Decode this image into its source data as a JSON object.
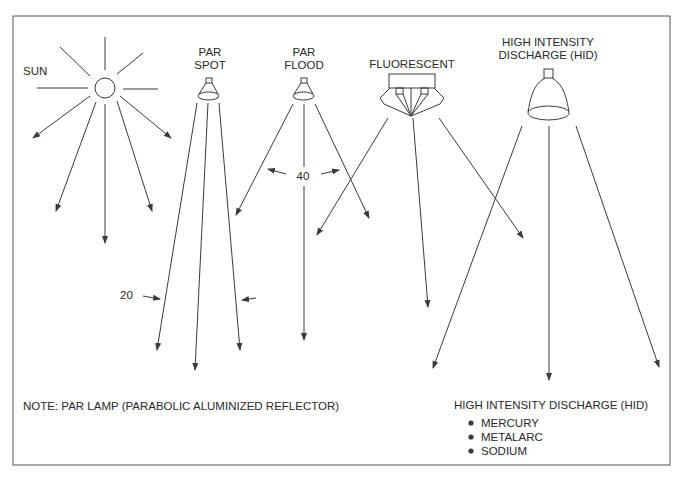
{
  "diagram": {
    "sources": {
      "sun": {
        "label": "SUN"
      },
      "par_spot": {
        "label_line1": "PAR",
        "label_line2": "SPOT",
        "angle_label": "20"
      },
      "par_flood": {
        "label_line1": "PAR",
        "label_line2": "FLOOD",
        "angle_label": "40"
      },
      "fluorescent": {
        "label": "FLUORESCENT"
      },
      "hid": {
        "label_line1": "HIGH INTENSITY",
        "label_line2": "DISCHARGE (HID)"
      }
    },
    "note": "NOTE: PAR LAMP (PARABOLIC ALUMINIZED REFLECTOR)",
    "hid_legend": {
      "title": "HIGH INTENSITY DISCHARGE (HID)",
      "items": [
        "MERCURY",
        "METALARC",
        "SODIUM"
      ]
    },
    "colors": {
      "line": "#3a3a3a",
      "frame": "#555555",
      "background": "#ffffff"
    }
  }
}
